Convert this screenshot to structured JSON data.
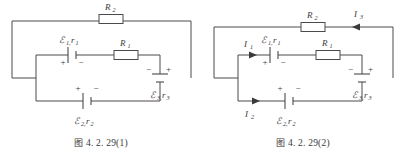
{
  "figures": [
    {
      "id": "fig1",
      "caption_prefix": "图",
      "caption_number": "4. 2. 29(1)",
      "components": {
        "r2": {
          "label": "R",
          "sub": "2",
          "name": "resistor-r2"
        },
        "r1": {
          "label": "R",
          "sub": "1",
          "name": "resistor-r1"
        },
        "e1": {
          "label": "ℰ",
          "sub": "1,",
          "sub2": "r",
          "sub3": "1",
          "plus": "+",
          "minus": "−",
          "name": "battery-e1-r1"
        },
        "e2": {
          "label": "ℰ",
          "sub": "2,",
          "sub2": "r",
          "sub3": "2",
          "plus": "+",
          "minus": "−",
          "name": "battery-e2-r2"
        },
        "e3": {
          "label": "ℰ",
          "sub": "3,",
          "sub2": "r",
          "sub3": "3",
          "plus": "+",
          "minus": "−",
          "name": "battery-e3-r3"
        }
      },
      "currents": []
    },
    {
      "id": "fig2",
      "caption_prefix": "图",
      "caption_number": "4. 2. 29(2)",
      "components": {
        "r2": {
          "label": "R",
          "sub": "2",
          "name": "resistor-r2"
        },
        "r1": {
          "label": "R",
          "sub": "1",
          "name": "resistor-r1"
        },
        "e1": {
          "label": "ℰ",
          "sub": "1,",
          "sub2": "r",
          "sub3": "1",
          "plus": "+",
          "minus": "−",
          "name": "battery-e1-r1"
        },
        "e2": {
          "label": "ℰ",
          "sub": "2,",
          "sub2": "r",
          "sub3": "2",
          "plus": "+",
          "minus": "−",
          "name": "battery-e2-r2"
        },
        "e3": {
          "label": "ℰ",
          "sub": "3,",
          "sub2": "r",
          "sub3": "3",
          "plus": "+",
          "minus": "−",
          "name": "battery-e3-r3"
        }
      },
      "currents": [
        {
          "label": "I",
          "sub": "1",
          "direction": "right",
          "name": "current-i1"
        },
        {
          "label": "I",
          "sub": "2",
          "direction": "right",
          "name": "current-i2"
        },
        {
          "label": "I",
          "sub": "3",
          "direction": "left",
          "name": "current-i3"
        }
      ]
    }
  ],
  "colors": {
    "wire": "#4a4a4a",
    "text": "#3a3a3a",
    "background": "#ffffff"
  }
}
